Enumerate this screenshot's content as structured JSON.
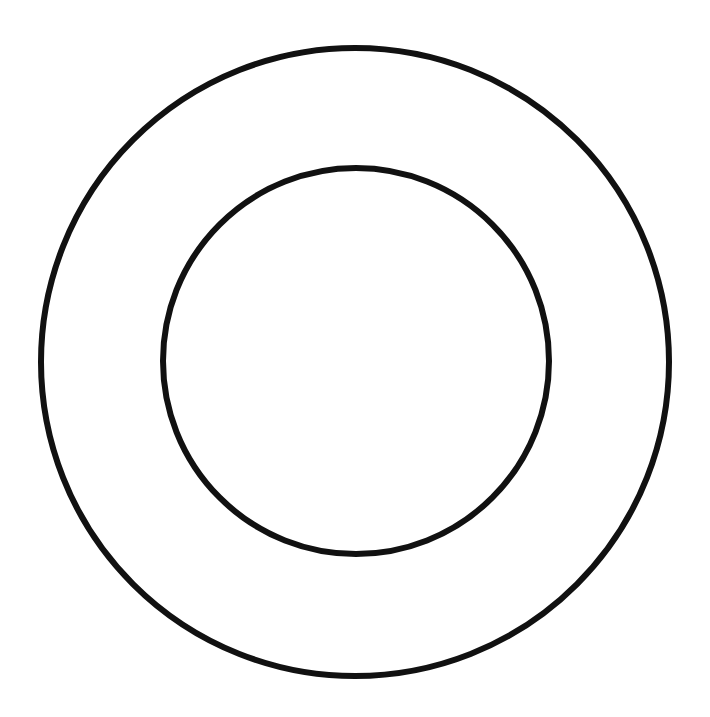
{
  "canvas": {
    "width": 710,
    "height": 717,
    "background": "#ffffff"
  },
  "diagram": {
    "type": "concentric-circles",
    "stroke_color": "#111111",
    "circles": [
      {
        "name": "outer-circle",
        "cx": 355,
        "cy": 362,
        "r": 314,
        "stroke_width": 6
      },
      {
        "name": "inner-circle",
        "cx": 356,
        "cy": 361,
        "r": 193,
        "stroke_width": 6
      }
    ]
  }
}
